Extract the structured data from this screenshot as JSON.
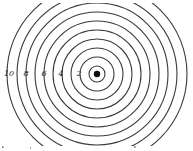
{
  "diagram": {
    "type": "concentric-circles",
    "center": {
      "x": 97,
      "y": 74
    },
    "source_dot": {
      "radius": 3.2,
      "color": "#111111"
    },
    "ring_color": "#3a3a3a",
    "clip": {
      "top": 3,
      "bottom": 146
    },
    "rings": [
      {
        "index": 1,
        "radius": 8
      },
      {
        "index": 2,
        "radius": 17
      },
      {
        "index": 3,
        "radius": 26
      },
      {
        "index": 4,
        "radius": 35
      },
      {
        "index": 5,
        "radius": 44
      },
      {
        "index": 6,
        "radius": 53
      },
      {
        "index": 7,
        "radius": 62
      },
      {
        "index": 8,
        "radius": 71
      },
      {
        "index": 9,
        "radius": 80
      },
      {
        "index": 10,
        "radius": 90
      }
    ],
    "labels": [
      {
        "text": "10",
        "x": 9,
        "y": 76
      },
      {
        "text": "8",
        "x": 26,
        "y": 76
      },
      {
        "text": "6",
        "x": 44,
        "y": 76
      },
      {
        "text": "4",
        "x": 61,
        "y": 76
      },
      {
        "text": "2",
        "x": 79,
        "y": 76
      }
    ]
  }
}
